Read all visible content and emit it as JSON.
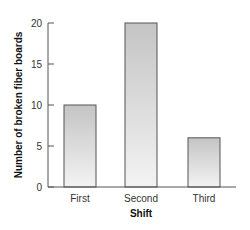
{
  "chart_data": {
    "type": "bar",
    "title": "",
    "xlabel": "Shift",
    "ylabel": "Number of broken fiber boards",
    "categories": [
      "First",
      "Second",
      "Third"
    ],
    "values": [
      10,
      20,
      6
    ],
    "ylim": [
      0,
      20
    ],
    "yticks": [
      0,
      5,
      10,
      15,
      20
    ],
    "grid": false,
    "legend": null,
    "colors": {
      "bar_top": "#c8c8c8",
      "bar_bottom": "#f2f2f2",
      "bar_border": "#555555",
      "axis": "#555555"
    }
  }
}
